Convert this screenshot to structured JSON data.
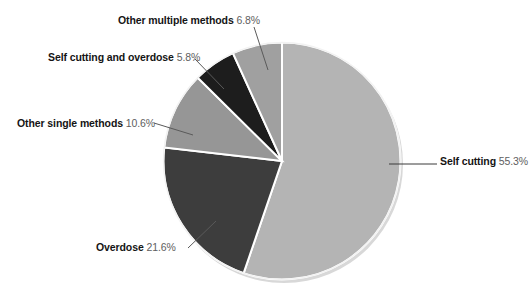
{
  "chart_data": {
    "type": "pie",
    "title": "",
    "subtitle": "",
    "xlabel": "",
    "ylabel": "",
    "legend_position": "none",
    "grid": false,
    "labels_format": "label + percent",
    "units": "percent",
    "categories": [
      "Self cutting",
      "Overdose",
      "Other single methods",
      "Self cutting and overdose",
      "Other multiple methods"
    ],
    "values": [
      55.3,
      21.6,
      10.6,
      5.8,
      6.8
    ],
    "slices": [
      {
        "label": "Self cutting",
        "percent_text": "55.3%",
        "value": 55.3,
        "color": "#b4b4b4",
        "start_angle_deg": 0,
        "end_angle_deg": 199.08
      },
      {
        "label": "Overdose",
        "percent_text": "21.6%",
        "value": 21.6,
        "color": "#3d3d3d",
        "start_angle_deg": 199.08,
        "end_angle_deg": 276.84
      },
      {
        "label": "Other single methods",
        "percent_text": "10.6%",
        "value": 10.6,
        "color": "#969696",
        "start_angle_deg": 276.84,
        "end_angle_deg": 314.0
      },
      {
        "label": "Self cutting and overdose",
        "percent_text": "5.8%",
        "value": 5.8,
        "color": "#1d1d1d",
        "start_angle_deg": 314.0,
        "end_angle_deg": 334.88
      },
      {
        "label": "Other multiple methods",
        "percent_text": "6.8%",
        "value": 6.8,
        "color": "#a0a0a0",
        "start_angle_deg": 334.88,
        "end_angle_deg": 360.0
      }
    ]
  },
  "callouts": {
    "other_multiple": {
      "label": "Other multiple methods",
      "percent": "6.8%"
    },
    "self_cutting_overdose": {
      "label": "Self cutting and overdose",
      "percent": "5.8%"
    },
    "other_single": {
      "label": "Other single methods",
      "percent": "10.6%"
    },
    "overdose": {
      "label": "Overdose",
      "percent": "21.6%"
    },
    "self_cutting": {
      "label": "Self cutting",
      "percent": "55.3%"
    }
  },
  "style": {
    "background": "#ffffff",
    "slice_border": "#ffffff",
    "leader_line": "#5a5a5a",
    "label_color": "#151515",
    "percent_color": "#5e5e5e"
  }
}
